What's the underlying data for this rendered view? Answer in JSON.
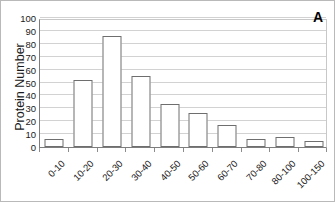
{
  "chart_data": {
    "type": "bar",
    "title": "",
    "panel_label": "A",
    "xlabel": "",
    "ylabel": "Protein Number",
    "categories": [
      "0-10",
      "10-20",
      "20-30",
      "30-40",
      "40-50",
      "50-60",
      "60-70",
      "70-80",
      "80-100",
      "100-150"
    ],
    "values": [
      6,
      52,
      86,
      55,
      33.5,
      26,
      17,
      6.5,
      7.5,
      5
    ],
    "ylim": [
      0,
      100
    ],
    "yticks": [
      0,
      10,
      20,
      30,
      40,
      50,
      60,
      70,
      80,
      90,
      100
    ],
    "ytick_labels": [
      "0",
      "10",
      "20",
      "30",
      "40",
      "50",
      "60",
      "70",
      "80",
      "90",
      "100"
    ],
    "grid": true,
    "grid_axis": "y",
    "legend": false,
    "bar_facecolor": "#ffffff",
    "bar_edgecolor": "#6e6e6e",
    "gridline_color": "#d2d2d2",
    "axis_color": "#7d7d7d"
  }
}
